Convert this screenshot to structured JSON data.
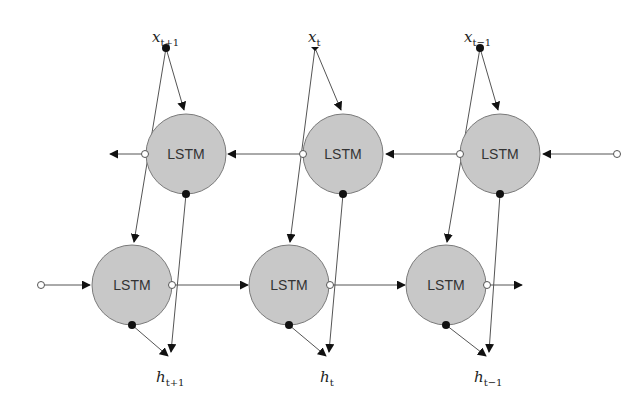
{
  "diagram": {
    "type": "bidirectional-lstm",
    "colors": {
      "cell_fill": "#c8c8c8",
      "cell_stroke": "#7a7a7a",
      "line": "#555555",
      "arrow": "#111111",
      "dot_filled": "#111111",
      "dot_open": "#ffffff"
    },
    "inputs": [
      {
        "label": "x",
        "sub": "t+1"
      },
      {
        "label": "x",
        "sub": "t"
      },
      {
        "label": "x",
        "sub": "t−1"
      }
    ],
    "outputs": [
      {
        "label": "h",
        "sub": "t+1"
      },
      {
        "label": "h",
        "sub": "t"
      },
      {
        "label": "h",
        "sub": "t−1"
      }
    ],
    "backward_layer": {
      "cells": [
        {
          "label": "LSTM"
        },
        {
          "label": "LSTM"
        },
        {
          "label": "LSTM"
        }
      ],
      "direction": "right-to-left"
    },
    "forward_layer": {
      "cells": [
        {
          "label": "LSTM"
        },
        {
          "label": "LSTM"
        },
        {
          "label": "LSTM"
        }
      ],
      "direction": "left-to-right"
    }
  }
}
